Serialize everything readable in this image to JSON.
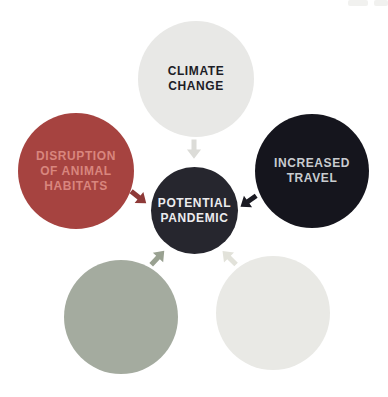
{
  "diagram": {
    "type": "cycle-cause-diagram",
    "center": {
      "label": "POTENTIAL\nPANDEMIC",
      "fill": "#26262e",
      "text_color": "#ececee"
    },
    "nodes": [
      {
        "id": "climate-change",
        "label": "CLIMATE\nCHANGE",
        "fill": "#e8e8e6",
        "text_color": "#1d1d27"
      },
      {
        "id": "animal-habitats",
        "label": "DISRUPTION\nOF ANIMAL\nHABITATS",
        "fill": "#a64340",
        "text_color": "#d9867e"
      },
      {
        "id": "increased-travel",
        "label": "INCREASED\nTRAVEL",
        "fill": "#15151d",
        "text_color": "#c9ccd0"
      },
      {
        "id": "green-factor",
        "label": "",
        "fill": "#a4ab9f",
        "text_color": "#ffffff"
      },
      {
        "id": "cream-factor",
        "label": "",
        "fill": "#e9e9e5",
        "text_color": "#1d1d27"
      }
    ],
    "arrows": [
      {
        "id": "climate-to-center",
        "direction": "down",
        "color": "#dcdcd8"
      },
      {
        "id": "habitats-to-center",
        "direction": "down-right",
        "color": "#8e3a38"
      },
      {
        "id": "travel-to-center",
        "direction": "down-left",
        "color": "#1a1a22"
      },
      {
        "id": "green-to-center",
        "direction": "up-right",
        "color": "#99a191"
      },
      {
        "id": "cream-to-center",
        "direction": "up-left",
        "color": "#e2e2da"
      }
    ],
    "background_color": "#ffffff"
  }
}
